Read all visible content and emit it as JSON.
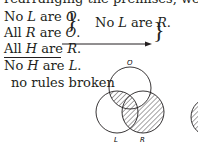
{
  "intro": "rearranging the premises, we have",
  "premises": [
    {
      "pre": "No ",
      "term1": "L",
      "mid": " are ",
      "term2": "O",
      "post": "."
    },
    {
      "pre": "All ",
      "term1": "R",
      "mid": " are ",
      "term2": "O",
      "post": "."
    },
    {
      "pre": "All ",
      "term1": "H",
      "mid": " are ",
      "term2": "R",
      "post": "."
    }
  ],
  "intermediate": {
    "pre": "No ",
    "term1": "L",
    "mid": " are ",
    "term2": "R",
    "post": "."
  },
  "conclusion": {
    "pre": "No ",
    "term1": "H",
    "mid": " are ",
    "term2": "L",
    "post": "."
  },
  "verdict": "no rules broken",
  "venn": {
    "labels": {
      "top": "O",
      "left": "L",
      "right": "R"
    },
    "shaded_regions": [
      "L∩O",
      "R outside O"
    ]
  }
}
